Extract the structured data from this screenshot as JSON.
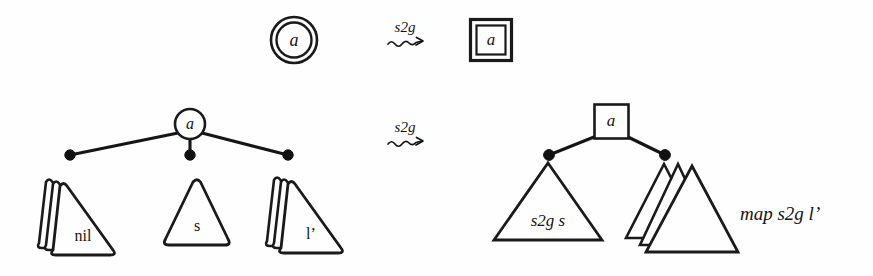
{
  "figure": {
    "background_color": "#fefefe",
    "ink_color": "#141414",
    "width": 873,
    "height": 276
  },
  "rows": [
    {
      "id": "row-atom",
      "left": {
        "shape": "double-circle",
        "label": "a"
      },
      "arrow": {
        "label": "s2g",
        "glyph": "squiggly-arrow"
      },
      "right": {
        "shape": "double-square",
        "label": "a"
      }
    },
    {
      "id": "row-tree",
      "left": {
        "root": {
          "shape": "circle",
          "label": "a"
        },
        "children": [
          {
            "shape": "triangle-stack",
            "label": "nil",
            "stack_count": 3,
            "corners": "rounded"
          },
          {
            "shape": "triangle",
            "label": "s",
            "stack_count": 1,
            "corners": "rounded"
          },
          {
            "shape": "triangle-stack",
            "label": "l’",
            "stack_count": 3,
            "corners": "rounded"
          }
        ]
      },
      "arrow": {
        "label": "s2g",
        "glyph": "squiggly-arrow"
      },
      "right": {
        "root": {
          "shape": "square",
          "label": "a"
        },
        "children": [
          {
            "shape": "triangle",
            "label": "s2g s",
            "stack_count": 1,
            "corners": "sharp"
          },
          {
            "shape": "triangle-stack",
            "label": "",
            "stack_count": 3,
            "corners": "sharp"
          }
        ],
        "side_label": "map s2g l’"
      }
    }
  ],
  "labels": {
    "atom_left": "a",
    "atom_right": "a",
    "arrow_top": "s2g",
    "arrow_bottom": "s2g",
    "tree_root_left": "a",
    "tree_root_right": "a",
    "child_nil": "nil",
    "child_s": "s",
    "child_lprime": "l’",
    "rt_child_s2gs": "s2g s",
    "rt_side_map": "map s2g l’"
  }
}
